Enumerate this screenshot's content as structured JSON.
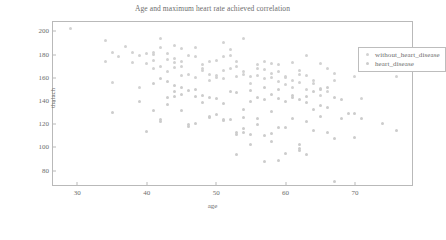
{
  "chart_data": {
    "type": "scatter",
    "title": "Age and maximum heart rate achieved correlation",
    "xlabel": "age",
    "ylabel": "thalach",
    "xlim": [
      26.5,
      78.5
    ],
    "ylim": [
      66,
      208
    ],
    "xticks": [
      30,
      40,
      50,
      60,
      70
    ],
    "yticks": [
      80,
      100,
      120,
      140,
      160,
      180,
      200
    ],
    "grid": false,
    "legend_position": "upper right",
    "marker": "circle",
    "marker_size": 3,
    "series": [
      {
        "name": "without_heart_disease",
        "color": "#d2d2d2",
        "points": [
          [
            29,
            202
          ],
          [
            34,
            192
          ],
          [
            35,
            182
          ],
          [
            37,
            187
          ],
          [
            38,
            182
          ],
          [
            39,
            179
          ],
          [
            40,
            181
          ],
          [
            41,
            182
          ],
          [
            41,
            180
          ],
          [
            42,
            194
          ],
          [
            43,
            181
          ],
          [
            44,
            188
          ],
          [
            44,
            173
          ],
          [
            45,
            185
          ],
          [
            46,
            179
          ],
          [
            47,
            186
          ],
          [
            48,
            168
          ],
          [
            49,
            163
          ],
          [
            50,
            162
          ],
          [
            51,
            190
          ],
          [
            52,
            184
          ],
          [
            53,
            174
          ],
          [
            54,
            194
          ],
          [
            54,
            163
          ],
          [
            55,
            161
          ],
          [
            56,
            162
          ],
          [
            57,
            174
          ],
          [
            58,
            172
          ],
          [
            59,
            165
          ],
          [
            60,
            160
          ],
          [
            61,
            173
          ],
          [
            62,
            163
          ],
          [
            63,
            179
          ],
          [
            64,
            158
          ],
          [
            65,
            172
          ],
          [
            66,
            168
          ],
          [
            67,
            164
          ],
          [
            34,
            174
          ],
          [
            35,
            156
          ],
          [
            36,
            178
          ],
          [
            38,
            173
          ],
          [
            39,
            152
          ],
          [
            40,
            172
          ],
          [
            41,
            175
          ],
          [
            42,
            170
          ],
          [
            43,
            165
          ],
          [
            44,
            169
          ],
          [
            45,
            170
          ],
          [
            46,
            163
          ],
          [
            47,
            160
          ],
          [
            48,
            166
          ],
          [
            49,
            158
          ],
          [
            50,
            160
          ],
          [
            51,
            166
          ],
          [
            52,
            168
          ],
          [
            53,
            161
          ],
          [
            54,
            165
          ],
          [
            55,
            155
          ],
          [
            56,
            168
          ],
          [
            57,
            159
          ],
          [
            58,
            160
          ],
          [
            59,
            157
          ],
          [
            60,
            161
          ],
          [
            61,
            152
          ],
          [
            62,
            156
          ],
          [
            63,
            150
          ],
          [
            64,
            155
          ],
          [
            65,
            151
          ],
          [
            66,
            148
          ],
          [
            51,
            178
          ],
          [
            52,
            179
          ],
          [
            43,
            176
          ],
          [
            44,
            177
          ],
          [
            45,
            174
          ],
          [
            42,
            186
          ],
          [
            47,
            178
          ],
          [
            48,
            171
          ],
          [
            50,
            175
          ],
          [
            53,
            170
          ],
          [
            56,
            171
          ],
          [
            59,
            171
          ],
          [
            62,
            166
          ],
          [
            41,
            168
          ],
          [
            45,
            162
          ],
          [
            49,
            174
          ],
          [
            51,
            159
          ],
          [
            57,
            167
          ],
          [
            58,
            164
          ],
          [
            60,
            154
          ],
          [
            61,
            158
          ],
          [
            63,
            162
          ],
          [
            65,
            145
          ],
          [
            67,
            158
          ],
          [
            70,
            161
          ],
          [
            76,
            161
          ],
          [
            71,
            142
          ]
        ]
      },
      {
        "name": "heart_disease",
        "color": "#cccccc",
        "points": [
          [
            35,
            130
          ],
          [
            39,
            140
          ],
          [
            40,
            114
          ],
          [
            41,
            132
          ],
          [
            42,
            122
          ],
          [
            43,
            143
          ],
          [
            43,
            137
          ],
          [
            44,
            144
          ],
          [
            44,
            153
          ],
          [
            45,
            152
          ],
          [
            45,
            132
          ],
          [
            46,
            120
          ],
          [
            46,
            118
          ],
          [
            47,
            150
          ],
          [
            48,
            139
          ],
          [
            49,
            126
          ],
          [
            50,
            128
          ],
          [
            51,
            123
          ],
          [
            51,
            124
          ],
          [
            52,
            148
          ],
          [
            53,
            111
          ],
          [
            53,
            113
          ],
          [
            53,
            94
          ],
          [
            54,
            116
          ],
          [
            54,
            113
          ],
          [
            55,
            111
          ],
          [
            55,
            103
          ],
          [
            56,
            125
          ],
          [
            56,
            120
          ],
          [
            57,
            88
          ],
          [
            57,
            110
          ],
          [
            58,
            105
          ],
          [
            58,
            112
          ],
          [
            59,
            117
          ],
          [
            59,
            89
          ],
          [
            60,
            95
          ],
          [
            60,
            117
          ],
          [
            61,
            125
          ],
          [
            62,
            103
          ],
          [
            62,
            97
          ],
          [
            62,
            99
          ],
          [
            63,
            122
          ],
          [
            63,
            94
          ],
          [
            64,
            133
          ],
          [
            64,
            115
          ],
          [
            65,
            127
          ],
          [
            66,
            113
          ],
          [
            67,
            71
          ],
          [
            67,
            108
          ],
          [
            68,
            125
          ],
          [
            69,
            129
          ],
          [
            70,
            109
          ],
          [
            74,
            121
          ],
          [
            76,
            115
          ],
          [
            42,
            124
          ],
          [
            47,
            121
          ],
          [
            49,
            127
          ],
          [
            52,
            124
          ],
          [
            54,
            126
          ],
          [
            55,
            140
          ],
          [
            56,
            143
          ],
          [
            57,
            141
          ],
          [
            58,
            146
          ],
          [
            59,
            142
          ],
          [
            60,
            140
          ],
          [
            61,
            145
          ],
          [
            62,
            141
          ],
          [
            63,
            144
          ],
          [
            64,
            148
          ],
          [
            65,
            136
          ],
          [
            66,
            134
          ],
          [
            58,
            131
          ],
          [
            54,
            133
          ],
          [
            50,
            142
          ],
          [
            48,
            145
          ],
          [
            44,
            148
          ],
          [
            46,
            149
          ],
          [
            41,
            155
          ],
          [
            42,
            159
          ],
          [
            43,
            157
          ],
          [
            45,
            146
          ],
          [
            47,
            144
          ],
          [
            49,
            143
          ],
          [
            51,
            138
          ],
          [
            53,
            147
          ],
          [
            55,
            149
          ],
          [
            57,
            152
          ],
          [
            59,
            150
          ],
          [
            61,
            143
          ],
          [
            63,
            139
          ],
          [
            65,
            150
          ],
          [
            66,
            152
          ],
          [
            70,
            129
          ],
          [
            71,
            125
          ],
          [
            67,
            143
          ],
          [
            68,
            141
          ]
        ]
      }
    ]
  },
  "legend": {
    "entries": [
      {
        "label": "without_heart_disease"
      },
      {
        "label": "heart_disease"
      }
    ]
  }
}
